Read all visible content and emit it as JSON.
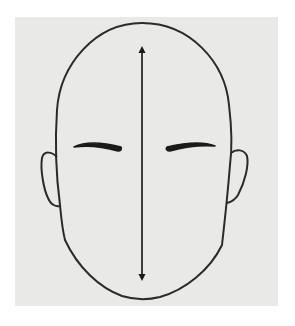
{
  "figure": {
    "background_color": "#e9e9e7",
    "line_color": "#2a2a2a",
    "elements": {
      "head_outline": "oval face outline",
      "ears": [
        "left-ear",
        "right-ear"
      ],
      "eyebrows": [
        "left-eyebrow",
        "right-eyebrow"
      ],
      "measurement_arrow": "vertical-double-arrow"
    }
  }
}
